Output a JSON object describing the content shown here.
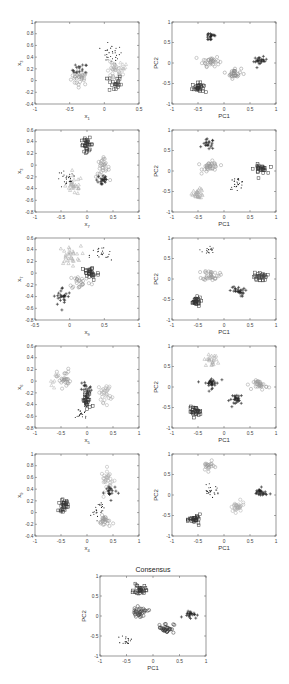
{
  "chart_data": [
    {
      "id": "p1",
      "type": "scatter",
      "title": "",
      "xlabel": "x1",
      "ylabel": "x3",
      "xlim": [
        -1,
        0.5
      ],
      "ylim": [
        -0.4,
        1
      ],
      "xticks": [
        -1,
        -0.5,
        0,
        0.5
      ],
      "yticks": [
        -0.4,
        -0.2,
        0,
        0.2,
        0.4,
        0.6,
        0.8,
        1
      ],
      "box": {
        "x": 35,
        "y": 22,
        "w": 104,
        "h": 82
      },
      "clusters": [
        {
          "marker": "circle",
          "shade": "#999999",
          "cx": -0.35,
          "cy": 0.05,
          "sx": 0.08,
          "sy": 0.08,
          "n": 30
        },
        {
          "marker": "plus",
          "shade": "#333333",
          "cx": -0.35,
          "cy": 0.18,
          "sx": 0.07,
          "sy": 0.07,
          "n": 18
        },
        {
          "marker": "dot",
          "shade": "#111111",
          "cx": 0.1,
          "cy": 0.45,
          "sx": 0.1,
          "sy": 0.1,
          "n": 30
        },
        {
          "marker": "circle",
          "shade": "#aaaaaa",
          "cx": 0.15,
          "cy": 0.15,
          "sx": 0.07,
          "sy": 0.1,
          "n": 30
        },
        {
          "marker": "square",
          "shade": "#444444",
          "cx": 0.15,
          "cy": -0.05,
          "sx": 0.06,
          "sy": 0.1,
          "n": 22
        },
        {
          "marker": "triangle",
          "shade": "#bbbbbb",
          "cx": 0.25,
          "cy": 0.25,
          "sx": 0.06,
          "sy": 0.06,
          "n": 8
        }
      ]
    },
    {
      "id": "p2",
      "type": "scatter",
      "title": "",
      "xlabel": "PC1",
      "ylabel": "PC2",
      "xlim": [
        -1,
        1
      ],
      "ylim": [
        -1,
        1
      ],
      "xticks": [
        -1,
        -0.5,
        0,
        0.5,
        1
      ],
      "yticks": [
        -1,
        -0.5,
        0,
        0.5,
        1
      ],
      "box": {
        "x": 172,
        "y": 22,
        "w": 104,
        "h": 82
      },
      "clusters": [
        {
          "marker": "plus",
          "shade": "#222222",
          "cx": -0.25,
          "cy": 0.65,
          "sx": 0.08,
          "sy": 0.08,
          "n": 20
        },
        {
          "marker": "circle",
          "shade": "#999999",
          "cx": -0.25,
          "cy": 0.05,
          "sx": 0.1,
          "sy": 0.08,
          "n": 35
        },
        {
          "marker": "square",
          "shade": "#333333",
          "cx": -0.5,
          "cy": -0.6,
          "sx": 0.07,
          "sy": 0.07,
          "n": 30
        },
        {
          "marker": "circle",
          "shade": "#888888",
          "cx": 0.2,
          "cy": -0.25,
          "sx": 0.08,
          "sy": 0.08,
          "n": 28
        },
        {
          "marker": "plus",
          "shade": "#222222",
          "cx": 0.7,
          "cy": 0.05,
          "sx": 0.08,
          "sy": 0.06,
          "n": 25
        }
      ]
    },
    {
      "id": "p3",
      "type": "scatter",
      "title": "",
      "xlabel": "x7",
      "ylabel": "x3",
      "xlim": [
        -1,
        1
      ],
      "ylim": [
        -0.8,
        0.6
      ],
      "xticks": [
        -1,
        -0.5,
        0,
        0.5,
        1
      ],
      "yticks": [
        -0.8,
        -0.6,
        -0.4,
        -0.2,
        0,
        0.2,
        0.4,
        0.6
      ],
      "box": {
        "x": 35,
        "y": 130,
        "w": 104,
        "h": 82
      },
      "clusters": [
        {
          "marker": "square",
          "shade": "#333333",
          "cx": 0.0,
          "cy": 0.35,
          "sx": 0.07,
          "sy": 0.07,
          "n": 30
        },
        {
          "marker": "circle",
          "shade": "#999999",
          "cx": 0.3,
          "cy": -0.05,
          "sx": 0.08,
          "sy": 0.1,
          "n": 30
        },
        {
          "marker": "plus",
          "shade": "#222222",
          "cx": 0.3,
          "cy": -0.25,
          "sx": 0.07,
          "sy": 0.08,
          "n": 22
        },
        {
          "marker": "triangle",
          "shade": "#aaaaaa",
          "cx": -0.25,
          "cy": -0.35,
          "sx": 0.1,
          "sy": 0.1,
          "n": 28
        },
        {
          "marker": "dot",
          "shade": "#111111",
          "cx": -0.4,
          "cy": -0.25,
          "sx": 0.12,
          "sy": 0.1,
          "n": 25
        }
      ]
    },
    {
      "id": "p4",
      "type": "scatter",
      "title": "",
      "xlabel": "PC1",
      "ylabel": "PC2",
      "xlim": [
        -1,
        1
      ],
      "ylim": [
        -1,
        1
      ],
      "xticks": [
        -1,
        -0.5,
        0,
        0.5,
        1
      ],
      "yticks": [
        -1,
        -0.5,
        0,
        0.5,
        1
      ],
      "box": {
        "x": 172,
        "y": 130,
        "w": 104,
        "h": 82
      },
      "clusters": [
        {
          "marker": "plus",
          "shade": "#222222",
          "cx": -0.3,
          "cy": 0.65,
          "sx": 0.07,
          "sy": 0.08,
          "n": 20
        },
        {
          "marker": "circle",
          "shade": "#999999",
          "cx": -0.25,
          "cy": 0.1,
          "sx": 0.1,
          "sy": 0.08,
          "n": 35
        },
        {
          "marker": "triangle",
          "shade": "#aaaaaa",
          "cx": -0.5,
          "cy": -0.55,
          "sx": 0.07,
          "sy": 0.07,
          "n": 30
        },
        {
          "marker": "dot",
          "shade": "#111111",
          "cx": 0.25,
          "cy": -0.3,
          "sx": 0.09,
          "sy": 0.09,
          "n": 26
        },
        {
          "marker": "square",
          "shade": "#333333",
          "cx": 0.7,
          "cy": 0.05,
          "sx": 0.08,
          "sy": 0.07,
          "n": 28
        }
      ]
    },
    {
      "id": "p5",
      "type": "scatter",
      "title": "",
      "xlabel": "x9",
      "ylabel": "x7",
      "xlim": [
        -0.5,
        1
      ],
      "ylim": [
        -0.8,
        0.6
      ],
      "xticks": [
        -0.5,
        0,
        0.5,
        1
      ],
      "yticks": [
        -0.8,
        -0.6,
        -0.4,
        -0.2,
        0,
        0.2,
        0.4,
        0.6
      ],
      "box": {
        "x": 35,
        "y": 238,
        "w": 104,
        "h": 82
      },
      "clusters": [
        {
          "marker": "triangle",
          "shade": "#aaaaaa",
          "cx": 0.0,
          "cy": 0.3,
          "sx": 0.1,
          "sy": 0.1,
          "n": 30
        },
        {
          "marker": "dot",
          "shade": "#111111",
          "cx": 0.45,
          "cy": 0.3,
          "sx": 0.1,
          "sy": 0.1,
          "n": 22
        },
        {
          "marker": "square",
          "shade": "#333333",
          "cx": 0.3,
          "cy": 0.0,
          "sx": 0.08,
          "sy": 0.08,
          "n": 30
        },
        {
          "marker": "circle",
          "shade": "#999999",
          "cx": 0.15,
          "cy": -0.15,
          "sx": 0.1,
          "sy": 0.08,
          "n": 25
        },
        {
          "marker": "plus",
          "shade": "#222222",
          "cx": -0.1,
          "cy": -0.4,
          "sx": 0.08,
          "sy": 0.1,
          "n": 25
        }
      ]
    },
    {
      "id": "p6",
      "type": "scatter",
      "title": "",
      "xlabel": "PC1",
      "ylabel": "PC2",
      "xlim": [
        -1,
        1
      ],
      "ylim": [
        -1,
        1
      ],
      "xticks": [
        -1,
        -0.5,
        0,
        0.5,
        1
      ],
      "yticks": [
        -1,
        -0.5,
        0,
        0.5,
        1
      ],
      "box": {
        "x": 172,
        "y": 238,
        "w": 104,
        "h": 82
      },
      "clusters": [
        {
          "marker": "dot",
          "shade": "#111111",
          "cx": -0.3,
          "cy": 0.7,
          "sx": 0.07,
          "sy": 0.07,
          "n": 18
        },
        {
          "marker": "circle",
          "shade": "#999999",
          "cx": -0.25,
          "cy": 0.1,
          "sx": 0.1,
          "sy": 0.08,
          "n": 35
        },
        {
          "marker": "square",
          "shade": "#333333",
          "cx": -0.55,
          "cy": -0.55,
          "sx": 0.07,
          "sy": 0.07,
          "n": 28
        },
        {
          "marker": "plus",
          "shade": "#222222",
          "cx": 0.25,
          "cy": -0.3,
          "sx": 0.09,
          "sy": 0.08,
          "n": 26
        },
        {
          "marker": "square",
          "shade": "#444444",
          "cx": 0.7,
          "cy": 0.05,
          "sx": 0.08,
          "sy": 0.07,
          "n": 30
        }
      ]
    },
    {
      "id": "p7",
      "type": "scatter",
      "title": "",
      "xlabel": "x5",
      "ylabel": "x6",
      "xlim": [
        -1,
        1
      ],
      "ylim": [
        -0.8,
        0.6
      ],
      "xticks": [
        -1,
        -0.5,
        0,
        0.5,
        1
      ],
      "yticks": [
        -0.8,
        -0.6,
        -0.4,
        -0.2,
        0,
        0.2,
        0.4,
        0.6
      ],
      "box": {
        "x": 35,
        "y": 346,
        "w": 104,
        "h": 82
      },
      "clusters": [
        {
          "marker": "circle",
          "shade": "#999999",
          "cx": -0.45,
          "cy": 0.05,
          "sx": 0.08,
          "sy": 0.1,
          "n": 30
        },
        {
          "marker": "triangle",
          "shade": "#bbbbbb",
          "cx": -0.65,
          "cy": -0.1,
          "sx": 0.06,
          "sy": 0.12,
          "n": 6
        },
        {
          "marker": "plus",
          "shade": "#222222",
          "cx": 0.0,
          "cy": -0.15,
          "sx": 0.06,
          "sy": 0.1,
          "n": 20
        },
        {
          "marker": "square",
          "shade": "#333333",
          "cx": 0.0,
          "cy": -0.35,
          "sx": 0.06,
          "sy": 0.1,
          "n": 28
        },
        {
          "marker": "dot",
          "shade": "#111111",
          "cx": -0.1,
          "cy": -0.55,
          "sx": 0.07,
          "sy": 0.07,
          "n": 20
        },
        {
          "marker": "circle",
          "shade": "#aaaaaa",
          "cx": 0.35,
          "cy": -0.2,
          "sx": 0.08,
          "sy": 0.1,
          "n": 28
        }
      ]
    },
    {
      "id": "p8",
      "type": "scatter",
      "title": "",
      "xlabel": "PC1",
      "ylabel": "PC2",
      "xlim": [
        -1,
        1
      ],
      "ylim": [
        -1,
        1
      ],
      "xticks": [
        -1,
        -0.5,
        0,
        0.5,
        1
      ],
      "yticks": [
        -1,
        -0.5,
        0,
        0.5,
        1
      ],
      "box": {
        "x": 172,
        "y": 346,
        "w": 104,
        "h": 82
      },
      "clusters": [
        {
          "marker": "triangle",
          "shade": "#aaaaaa",
          "cx": -0.25,
          "cy": 0.65,
          "sx": 0.08,
          "sy": 0.08,
          "n": 22
        },
        {
          "marker": "plus",
          "shade": "#222222",
          "cx": -0.25,
          "cy": 0.1,
          "sx": 0.1,
          "sy": 0.08,
          "n": 30
        },
        {
          "marker": "square",
          "shade": "#333333",
          "cx": -0.55,
          "cy": -0.6,
          "sx": 0.07,
          "sy": 0.07,
          "n": 30
        },
        {
          "marker": "plus",
          "shade": "#222222",
          "cx": 0.25,
          "cy": -0.3,
          "sx": 0.09,
          "sy": 0.08,
          "n": 26
        },
        {
          "marker": "circle",
          "shade": "#999999",
          "cx": 0.7,
          "cy": 0.05,
          "sx": 0.08,
          "sy": 0.07,
          "n": 30
        }
      ]
    },
    {
      "id": "p9",
      "type": "scatter",
      "title": "",
      "xlabel": "x4",
      "ylabel": "x9",
      "xlim": [
        -1,
        1
      ],
      "ylim": [
        -0.4,
        1
      ],
      "xticks": [
        -1,
        -0.5,
        0,
        0.5,
        1
      ],
      "yticks": [
        -0.4,
        -0.2,
        0,
        0.2,
        0.4,
        0.6,
        0.8,
        1
      ],
      "box": {
        "x": 35,
        "y": 454,
        "w": 104,
        "h": 82
      },
      "clusters": [
        {
          "marker": "square",
          "shade": "#333333",
          "cx": -0.45,
          "cy": 0.12,
          "sx": 0.06,
          "sy": 0.06,
          "n": 28
        },
        {
          "marker": "circle",
          "shade": "#aaaaaa",
          "cx": 0.4,
          "cy": 0.55,
          "sx": 0.08,
          "sy": 0.12,
          "n": 30
        },
        {
          "marker": "plus",
          "shade": "#222222",
          "cx": 0.45,
          "cy": 0.35,
          "sx": 0.07,
          "sy": 0.08,
          "n": 20
        },
        {
          "marker": "dot",
          "shade": "#111111",
          "cx": 0.2,
          "cy": 0.05,
          "sx": 0.08,
          "sy": 0.1,
          "n": 25
        },
        {
          "marker": "circle",
          "shade": "#999999",
          "cx": 0.35,
          "cy": -0.15,
          "sx": 0.07,
          "sy": 0.06,
          "n": 25
        }
      ]
    },
    {
      "id": "p10",
      "type": "scatter",
      "title": "",
      "xlabel": "PC1",
      "ylabel": "PC2",
      "xlim": [
        -1,
        1
      ],
      "ylim": [
        -1,
        1
      ],
      "xticks": [
        -1,
        -0.5,
        0,
        0.5,
        1
      ],
      "yticks": [
        -1,
        -0.5,
        0,
        0.5,
        1
      ],
      "box": {
        "x": 172,
        "y": 454,
        "w": 104,
        "h": 82
      },
      "clusters": [
        {
          "marker": "circle",
          "shade": "#999999",
          "cx": -0.3,
          "cy": 0.7,
          "sx": 0.07,
          "sy": 0.07,
          "n": 20
        },
        {
          "marker": "dot",
          "shade": "#111111",
          "cx": -0.25,
          "cy": 0.1,
          "sx": 0.1,
          "sy": 0.08,
          "n": 26
        },
        {
          "marker": "square",
          "shade": "#333333",
          "cx": -0.55,
          "cy": -0.6,
          "sx": 0.07,
          "sy": 0.07,
          "n": 30
        },
        {
          "marker": "circle",
          "shade": "#aaaaaa",
          "cx": 0.25,
          "cy": -0.3,
          "sx": 0.09,
          "sy": 0.08,
          "n": 28
        },
        {
          "marker": "plus",
          "shade": "#222222",
          "cx": 0.7,
          "cy": 0.05,
          "sx": 0.08,
          "sy": 0.07,
          "n": 28
        }
      ]
    },
    {
      "id": "consensus",
      "type": "scatter",
      "title": "Consensus",
      "xlabel": "PC1",
      "ylabel": "PC2",
      "xlim": [
        -1,
        1
      ],
      "ylim": [
        -1,
        1
      ],
      "xticks": [
        -1,
        -0.5,
        0,
        0.5,
        1
      ],
      "yticks": [
        -1,
        -0.5,
        0,
        0.5,
        1
      ],
      "box": {
        "x": 100,
        "y": 576,
        "w": 106,
        "h": 80
      },
      "clusters": [
        {
          "marker": "square",
          "shade": "#333333",
          "cx": -0.25,
          "cy": 0.65,
          "sx": 0.07,
          "sy": 0.08,
          "n": 30
        },
        {
          "marker": "circle",
          "shade": "#444444",
          "cx": -0.25,
          "cy": 0.1,
          "sx": 0.1,
          "sy": 0.07,
          "n": 35
        },
        {
          "marker": "dot",
          "shade": "#111111",
          "cx": -0.5,
          "cy": -0.6,
          "sx": 0.06,
          "sy": 0.07,
          "n": 18
        },
        {
          "marker": "circle",
          "shade": "#333333",
          "cx": 0.25,
          "cy": -0.3,
          "sx": 0.09,
          "sy": 0.08,
          "n": 30
        },
        {
          "marker": "plus",
          "shade": "#222222",
          "cx": 0.7,
          "cy": 0.05,
          "sx": 0.08,
          "sy": 0.06,
          "n": 22
        }
      ]
    }
  ]
}
